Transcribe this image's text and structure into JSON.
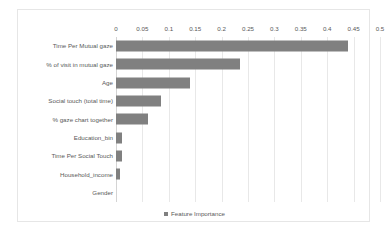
{
  "chart_data": {
    "type": "bar",
    "orientation": "horizontal",
    "title": "",
    "xlabel": "",
    "ylabel": "",
    "xlim": [
      0,
      0.5
    ],
    "xticks": [
      "0",
      "0.05",
      "0.1",
      "0.15",
      "0.2",
      "0.25",
      "0.3",
      "0.35",
      "0.4",
      "0.45",
      "0.5"
    ],
    "xtick_values": [
      0,
      0.05,
      0.1,
      0.15,
      0.2,
      0.25,
      0.3,
      0.35,
      0.4,
      0.45,
      0.5
    ],
    "grid": true,
    "grid_axis": "x",
    "legend": {
      "position": "bottom-center",
      "entries": [
        {
          "label": "Feature Importance",
          "color": "#808080",
          "marker": "square"
        }
      ]
    },
    "series": [
      {
        "name": "Feature Importance",
        "color": "#808080",
        "values": [
          0.44,
          0.235,
          0.14,
          0.085,
          0.06,
          0.012,
          0.012,
          0.007,
          0.0
        ]
      }
    ],
    "categories": [
      "Time Per Mutual gaze",
      "% of visit in mutual gaze",
      "Age",
      "Social touch (total time)",
      "% gaze chart together",
      "Education_bin",
      "Time Per Social Touch",
      "Household_income",
      "Gender"
    ]
  },
  "style": {
    "bar_color": "#808080",
    "gridline_color": "#e8e8e8",
    "axis_line_color": "#d4d4d4",
    "frame_color": "#e6e6e6",
    "text_color": "#595959",
    "background": "#ffffff"
  }
}
